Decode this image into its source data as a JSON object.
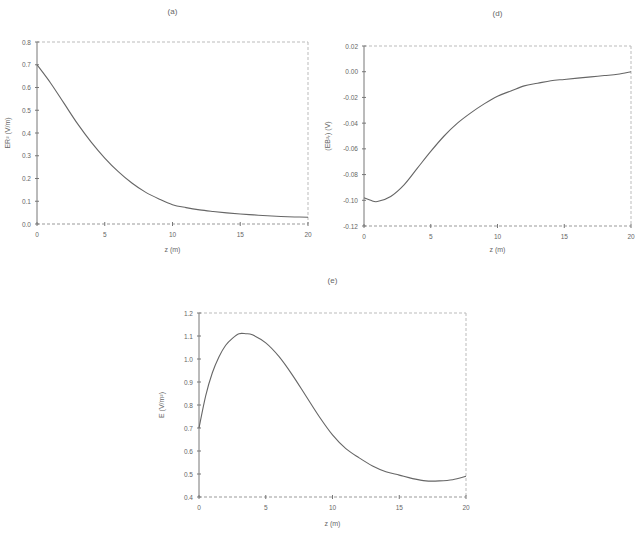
{
  "chart_data": [
    {
      "id": "a",
      "type": "line",
      "title": "(a)",
      "xlabel": "z (m)",
      "ylabel": "ER² (V/m)",
      "xlim": [
        0,
        20
      ],
      "ylim": [
        0.0,
        0.8
      ],
      "xticks": [
        "0",
        "5",
        "10",
        "15",
        "20"
      ],
      "yticks": [
        "0.0",
        "0.1",
        "0.2",
        "0.3",
        "0.4",
        "0.5",
        "0.6",
        "0.7",
        "0.8"
      ],
      "grid": false,
      "x": [
        0,
        1,
        2,
        3,
        4,
        5,
        6,
        7,
        8,
        9,
        10,
        11,
        12,
        13,
        14,
        15,
        16,
        17,
        18,
        19,
        20
      ],
      "series": [
        {
          "name": "ER²",
          "values": [
            0.7,
            0.62,
            0.53,
            0.44,
            0.36,
            0.29,
            0.23,
            0.18,
            0.14,
            0.11,
            0.085,
            0.072,
            0.062,
            0.055,
            0.049,
            0.044,
            0.04,
            0.036,
            0.033,
            0.031,
            0.03
          ]
        }
      ]
    },
    {
      "id": "d",
      "type": "line",
      "title": "(d)",
      "xlabel": "z (m)",
      "ylabel": "(EB²ᵣ) (V)",
      "xlim": [
        0,
        20
      ],
      "ylim": [
        -0.12,
        0.02
      ],
      "xticks": [
        "0",
        "5",
        "10",
        "15",
        "20"
      ],
      "yticks": [
        "-0.12",
        "-0.10",
        "-0.08",
        "-0.06",
        "-0.04",
        "-0.02",
        "0.00",
        "0.02"
      ],
      "grid": false,
      "x": [
        0,
        0.5,
        1,
        2,
        3,
        4,
        5,
        6,
        7,
        8,
        9,
        10,
        11,
        12,
        13,
        14,
        15,
        16,
        17,
        18,
        19,
        20
      ],
      "series": [
        {
          "name": "EB²",
          "values": [
            -0.098,
            -0.1,
            -0.101,
            -0.097,
            -0.088,
            -0.075,
            -0.062,
            -0.05,
            -0.04,
            -0.032,
            -0.025,
            -0.019,
            -0.015,
            -0.011,
            -0.009,
            -0.007,
            -0.006,
            -0.005,
            -0.004,
            -0.003,
            -0.002,
            0.0
          ]
        }
      ]
    },
    {
      "id": "e",
      "type": "line",
      "title": "(e)",
      "xlabel": "z (m)",
      "ylabel": "E (V/m²)",
      "xlim": [
        0,
        20
      ],
      "ylim": [
        0.4,
        1.2
      ],
      "xticks": [
        "0",
        "5",
        "10",
        "15",
        "20"
      ],
      "yticks": [
        "0.4",
        "0.5",
        "0.6",
        "0.7",
        "0.8",
        "0.9",
        "1.0",
        "1.1",
        "1.2"
      ],
      "grid": false,
      "x": [
        0,
        0.5,
        1,
        1.5,
        2,
        2.5,
        3,
        3.5,
        4,
        5,
        6,
        7,
        8,
        9,
        10,
        11,
        12,
        13,
        14,
        15,
        16,
        17,
        18,
        19,
        20
      ],
      "series": [
        {
          "name": "E",
          "values": [
            0.7,
            0.84,
            0.94,
            1.01,
            1.06,
            1.09,
            1.11,
            1.11,
            1.105,
            1.07,
            1.01,
            0.93,
            0.84,
            0.75,
            0.67,
            0.61,
            0.57,
            0.535,
            0.51,
            0.495,
            0.48,
            0.47,
            0.47,
            0.475,
            0.49
          ]
        }
      ]
    }
  ]
}
